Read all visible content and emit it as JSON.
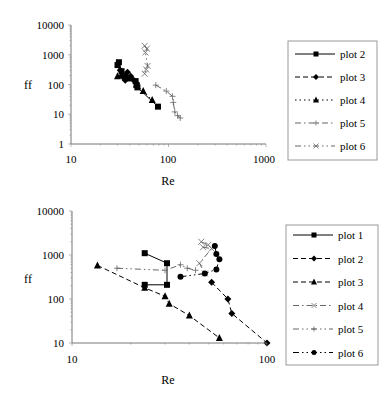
{
  "chart_data": [
    {
      "type": "line",
      "title": "",
      "xlabel": "Re",
      "ylabel": "ff",
      "xscale": "log",
      "yscale": "log",
      "xlim": [
        10,
        1000
      ],
      "ylim": [
        1,
        10000
      ],
      "x_ticks": [
        "10",
        "100",
        "1000"
      ],
      "y_ticks": [
        "1",
        "10",
        "100",
        "1000",
        "10000"
      ],
      "grid": false,
      "legend_position": "right",
      "series": [
        {
          "name": "plot 2",
          "marker": "square",
          "line": "solid",
          "points": [
            [
              30,
              450
            ],
            [
              31,
              560
            ],
            [
              33,
              280
            ],
            [
              36,
              200
            ],
            [
              40,
              160
            ],
            [
              46,
              130
            ],
            [
              47,
              95
            ],
            [
              48,
              80
            ],
            [
              78,
              18
            ]
          ]
        },
        {
          "name": "plot 3",
          "marker": "diamond",
          "line": "dashed",
          "points": [
            [
              32,
              300
            ],
            [
              34,
              180
            ],
            [
              36,
              140
            ],
            [
              38,
              260
            ],
            [
              41,
              190
            ],
            [
              44,
              140
            ],
            [
              47,
              110
            ]
          ]
        },
        {
          "name": "plot 4",
          "marker": "triangle",
          "line": "dotted",
          "points": [
            [
              30,
              190
            ],
            [
              33,
              220
            ],
            [
              47,
              100
            ],
            [
              55,
              60
            ],
            [
              68,
              30
            ]
          ]
        },
        {
          "name": "plot 5",
          "marker": "plus",
          "line": "dash-dot",
          "points": [
            [
              74,
              95
            ],
            [
              95,
              60
            ],
            [
              110,
              40
            ],
            [
              112,
              25
            ],
            [
              116,
              12
            ],
            [
              124,
              9
            ],
            [
              132,
              7.5
            ]
          ]
        },
        {
          "name": "plot 6",
          "marker": "x",
          "line": "dash-dot-dot",
          "points": [
            [
              57,
              2000
            ],
            [
              60,
              1600
            ],
            [
              58,
              1200
            ],
            [
              61,
              420
            ],
            [
              59,
              320
            ],
            [
              57,
              230
            ]
          ]
        }
      ]
    },
    {
      "type": "line",
      "title": "",
      "xlabel": "Re",
      "ylabel": "ff",
      "xscale": "log",
      "yscale": "log",
      "xlim": [
        10,
        100
      ],
      "ylim": [
        10,
        10000
      ],
      "x_ticks": [
        "10",
        "100"
      ],
      "y_ticks": [
        "10",
        "100",
        "1000",
        "10000"
      ],
      "grid": false,
      "legend_position": "right",
      "series": [
        {
          "name": "plot 1",
          "marker": "square",
          "line": "solid",
          "points": [
            [
              23.6,
              1100
            ],
            [
              30.7,
              650
            ],
            [
              30.7,
              210
            ],
            [
              23.6,
              210
            ]
          ]
        },
        {
          "name": "plot 2",
          "marker": "diamond",
          "line": "dashed",
          "points": [
            [
              52,
              240
            ],
            [
              63,
              100
            ],
            [
              66,
              47
            ],
            [
              100,
              10
            ]
          ]
        },
        {
          "name": "plot 3",
          "marker": "triangle",
          "line": "dashed",
          "points": [
            [
              13.5,
              580
            ],
            [
              23.6,
              180
            ],
            [
              30,
              115
            ],
            [
              31.5,
              78
            ],
            [
              40,
              42
            ],
            [
              57,
              13
            ]
          ]
        },
        {
          "name": "plot 4",
          "marker": "x",
          "line": "dash-dot",
          "points": [
            [
              46,
              2000
            ],
            [
              50,
              1700
            ],
            [
              47,
              1500
            ],
            [
              52,
              1400
            ],
            [
              45,
              650
            ],
            [
              48,
              380
            ]
          ]
        },
        {
          "name": "plot 5",
          "marker": "plus",
          "line": "dash-dot-dot",
          "points": [
            [
              17,
              500
            ],
            [
              30,
              450
            ],
            [
              36,
              600
            ],
            [
              39,
              500
            ],
            [
              43,
              450
            ]
          ]
        },
        {
          "name": "plot 6",
          "marker": "circle",
          "line": "dash-dot-dot",
          "points": [
            [
              36,
              320
            ],
            [
              48,
              380
            ],
            [
              55,
              470
            ],
            [
              57,
              800
            ],
            [
              55,
              1050
            ],
            [
              54,
              1600
            ]
          ]
        }
      ]
    }
  ],
  "charts": {
    "top": {
      "xlabel": "Re",
      "ylabel": "ff",
      "y_ticks": [
        "10000",
        "1000",
        "100",
        "10",
        "1"
      ],
      "x_ticks": [
        "10",
        "100",
        "1000"
      ],
      "legend": [
        "plot 2",
        "plot 3",
        "plot 4",
        "plot 5",
        "plot 6"
      ]
    },
    "bottom": {
      "xlabel": "Re",
      "ylabel": "ff",
      "y_ticks": [
        "10000",
        "1000",
        "100",
        "10"
      ],
      "x_ticks": [
        "10",
        "100"
      ],
      "legend": [
        "plot 1",
        "plot 2",
        "plot 3",
        "plot 4",
        "plot 5",
        "plot 6"
      ]
    }
  }
}
